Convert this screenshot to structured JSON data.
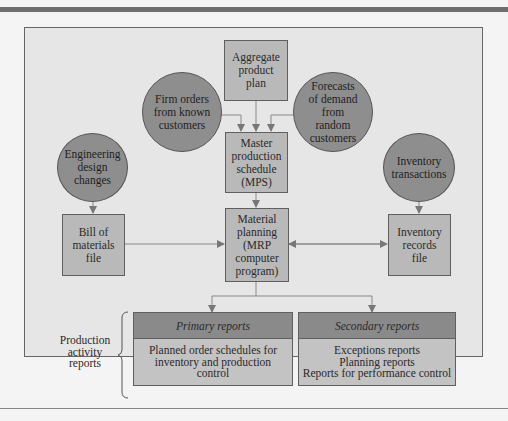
{
  "diagram": {
    "nodes": {
      "aggregate_plan": "Aggregate\nproduct\nplan",
      "firm_orders": "Firm orders\nfrom known\ncustomers",
      "forecasts": "Forecasts\nof demand\nfrom\nrandom\ncustomers",
      "mps": "Master\nproduction\nschedule\n(MPS)",
      "engineering_changes": "Engineering\ndesign\nchanges",
      "inventory_transactions": "Inventory\ntransactions",
      "bill_of_materials": "Bill of\nmaterials\nfile",
      "mrp": "Material\nplanning\n(MRP\ncomputer\nprogram)",
      "inventory_records": "Inventory\nrecords\nfile"
    },
    "reports": {
      "group_label": "Production\nactivity\nreports",
      "primary": {
        "title": "Primary reports",
        "body": "Planned order schedules for\ninventory and production\ncontrol"
      },
      "secondary": {
        "title": "Secondary reports",
        "body": "Exceptions reports\nPlanning reports\nReports for performance control"
      }
    },
    "colors": {
      "box_fill": "#b9b9b9",
      "circle_fill": "#8e8e8e",
      "header_fill": "#8a8a8a",
      "frame_fill": "#e6e6e6",
      "line": "#777777"
    }
  }
}
